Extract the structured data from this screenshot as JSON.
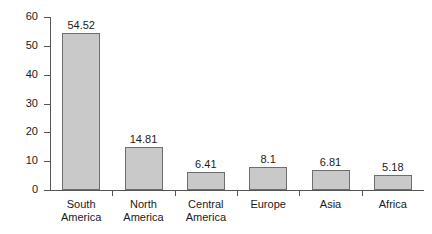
{
  "chart_data": {
    "type": "bar",
    "title": "",
    "xlabel": "",
    "ylabel": "Percentage of exports",
    "categories": [
      "South\nAmerica",
      "North\nAmerica",
      "Central\nAmerica",
      "Europe",
      "Asia",
      "Africa"
    ],
    "values": [
      54.52,
      14.81,
      6.41,
      8.1,
      6.81,
      5.18
    ],
    "value_labels": [
      "54.52",
      "14.81",
      "6.41",
      "8.1",
      "6.81",
      "5.18"
    ],
    "ylim": [
      0,
      60
    ],
    "yticks": [
      0,
      10,
      20,
      30,
      40,
      50,
      60
    ],
    "ytick_labels": [
      "0",
      "10",
      "20",
      "30",
      "40",
      "50",
      "60"
    ],
    "grid": false,
    "legend": false,
    "bar_fill": "#c9c9c9",
    "bar_border": "#6e6e6e",
    "axis_color": "#555555",
    "text_color": "#1a1a1a"
  }
}
